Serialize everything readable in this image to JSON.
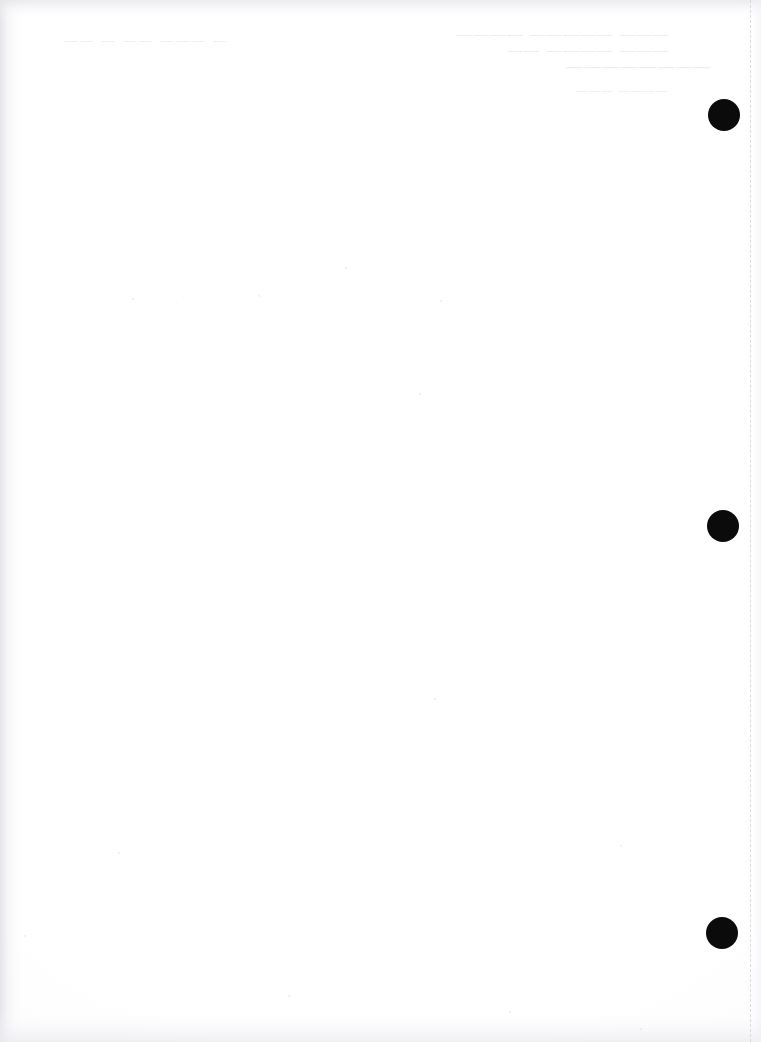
{
  "document": {
    "kind": "scanned-page",
    "page_state": "blank",
    "width_px": 761,
    "height_px": 1042,
    "background_color": "#ffffff",
    "note_visible_text": ""
  },
  "marks": {
    "label": "black circular registration marks",
    "color": "#0b0b0b",
    "diameter_px": 32,
    "items": [
      {
        "name": "mark-top",
        "cx": 724,
        "cy": 115,
        "d": 32
      },
      {
        "name": "mark-middle",
        "cx": 723,
        "cy": 526,
        "d": 32
      },
      {
        "name": "mark-bottom",
        "cx": 722,
        "cy": 933,
        "d": 32
      }
    ]
  },
  "perforation": {
    "label": "dashed tear/perforation line",
    "color": "#cdcdd6",
    "x_px": 750,
    "orientation": "vertical"
  },
  "ghost_text": {
    "label": "faint show-through text from reverse side (illegible)",
    "color": "#c4c4cc",
    "blocks": [
      {
        "name": "ghost-block-left",
        "x": 62,
        "y": 34,
        "font_size": 13,
        "letter_spacing": 2.5,
        "lines": [
          "— ———  —— —  ——"
        ]
      },
      {
        "name": "ghost-block-center",
        "x": 455,
        "y": 26,
        "font_size": 15,
        "letter_spacing": 1.8,
        "lines": [
          "——— ————— ————",
          "———  ————  ——"
        ]
      },
      {
        "name": "ghost-block-upper-right",
        "x": 565,
        "y": 58,
        "font_size": 17,
        "letter_spacing": 1.2,
        "lines": [
          "————————"
        ]
      },
      {
        "name": "ghost-block-lower",
        "x": 575,
        "y": 85,
        "font_size": 11,
        "letter_spacing": 1.5,
        "lines": [
          "———— ———"
        ]
      }
    ]
  },
  "specks": [
    {
      "x": 132,
      "y": 298,
      "d": 2
    },
    {
      "x": 258,
      "y": 295,
      "d": 2
    },
    {
      "x": 260,
      "y": 297,
      "d": 1
    },
    {
      "x": 183,
      "y": 297,
      "d": 1
    },
    {
      "x": 440,
      "y": 300,
      "d": 2
    },
    {
      "x": 345,
      "y": 267,
      "d": 2
    },
    {
      "x": 419,
      "y": 393,
      "d": 2
    },
    {
      "x": 434,
      "y": 698,
      "d": 2
    },
    {
      "x": 620,
      "y": 845,
      "d": 2
    },
    {
      "x": 288,
      "y": 995,
      "d": 2
    },
    {
      "x": 640,
      "y": 1028,
      "d": 2
    },
    {
      "x": 118,
      "y": 852,
      "d": 2
    },
    {
      "x": 509,
      "y": 1011,
      "d": 2
    },
    {
      "x": 24,
      "y": 935,
      "d": 2
    }
  ]
}
